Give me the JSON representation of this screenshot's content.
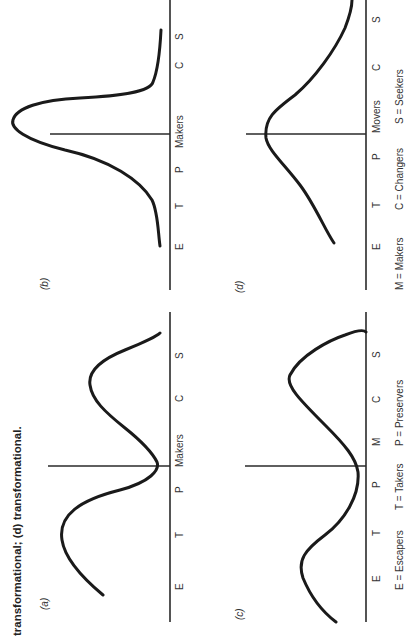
{
  "caption": {
    "text": "transformational; (d) transformational."
  },
  "panels": {
    "a": {
      "label": "(a)",
      "axis_labels": [
        "E",
        "T",
        "P",
        "Makers",
        "C",
        "S"
      ],
      "shape": "bimodal, peaks at T and C/S, trough at Makers"
    },
    "b": {
      "label": "(b)",
      "axis_labels": [
        "E",
        "T",
        "P",
        "Makers",
        "C",
        "S"
      ],
      "shape": "sharp single peak at Makers"
    },
    "c": {
      "label": "(c)",
      "axis_labels": [
        "E",
        "T",
        "P",
        "M",
        "C",
        "S"
      ],
      "shape": "bimodal, peaks at E/T and C/S, trough at P/M"
    },
    "d": {
      "label": "(d)",
      "axis_labels": [
        "E",
        "T",
        "P",
        "Movers",
        "C",
        "S"
      ],
      "shape": "broad single peak near Movers"
    }
  },
  "legend": {
    "row1": [
      "E = Escapers",
      "T = Takers",
      "P = Preservers"
    ],
    "row2": [
      "M = Makers",
      "C = Changers",
      "S = Seekers"
    ]
  },
  "colors": {
    "ink": "#1a1a1a",
    "background": "#ffffff"
  }
}
